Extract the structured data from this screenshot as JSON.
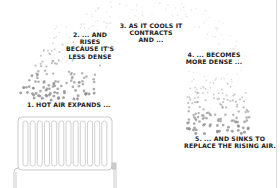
{
  "diagram": {
    "colors": {
      "background": "#ffffff",
      "text": "#222222",
      "dots": "#8a8a8a",
      "radiator_stroke": "#bdbdbd"
    },
    "steps": [
      {
        "number": "1",
        "lines": [
          "1. HOT AIR EXPANDS ..."
        ]
      },
      {
        "number": "2",
        "lines": [
          "2. ... AND",
          "RISES",
          "BECAUSE IT'S",
          "LESS DENSE"
        ]
      },
      {
        "number": "3",
        "lines": [
          "3. AS IT COOLS IT",
          "CONTRACTS",
          "AND ..."
        ]
      },
      {
        "number": "4",
        "lines": [
          "4. ... BECOMES",
          "MORE DENSE ..."
        ]
      },
      {
        "number": "5",
        "lines": [
          "5. ... AND SINKS TO",
          "REPLACE THE RISING AIR."
        ]
      }
    ],
    "radiator": {
      "fin_count": 12,
      "icon": "radiator-icon"
    },
    "particles": {
      "icon": "air-particle-dots",
      "arc": "rises left, arcs over top, sinks right"
    }
  }
}
